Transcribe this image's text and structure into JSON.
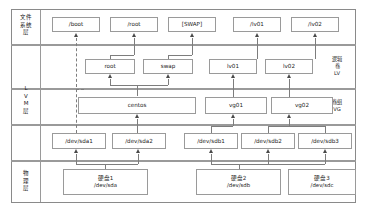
{
  "diagram": {
    "layers": [
      {
        "id": "fs",
        "label_chars": [
          "文件",
          "系统",
          "层"
        ]
      },
      {
        "id": "lvm",
        "label_chars": [
          "L",
          "V",
          "M",
          "层"
        ]
      },
      {
        "id": "physical",
        "label_chars": [
          "物",
          "理",
          "层"
        ]
      }
    ],
    "roles": [
      {
        "id": "lv",
        "name_chars": [
          "逻辑",
          "卷",
          "LV"
        ]
      },
      {
        "id": "vg",
        "name_chars": [
          "卷组",
          "VG"
        ]
      },
      {
        "id": "pv",
        "name_chars": [
          "物理卷",
          "PV"
        ]
      }
    ],
    "mountpoints": [
      {
        "id": "mp-boot",
        "label": "/boot"
      },
      {
        "id": "mp-root",
        "label": "/root"
      },
      {
        "id": "mp-swap",
        "label": "[SWAP]"
      },
      {
        "id": "mp-lv01",
        "label": "/lv01"
      },
      {
        "id": "mp-lv02",
        "label": "/lv02"
      }
    ],
    "logical_volumes": [
      {
        "id": "lv-root",
        "label": "root"
      },
      {
        "id": "lv-swap",
        "label": "swap"
      },
      {
        "id": "lv-lv01",
        "label": "lv01"
      },
      {
        "id": "lv-lv02",
        "label": "lv02"
      }
    ],
    "volume_groups": [
      {
        "id": "vg-centos",
        "label": "centos"
      },
      {
        "id": "vg-vg01",
        "label": "vg01"
      },
      {
        "id": "vg-vg02",
        "label": "vg02"
      }
    ],
    "physical_volumes": [
      {
        "id": "pv-sda1",
        "label": "/dev/sda1"
      },
      {
        "id": "pv-sda2",
        "label": "/dev/sda2"
      },
      {
        "id": "pv-sdb1",
        "label": "/dev/sdb1"
      },
      {
        "id": "pv-sdb2",
        "label": "/dev/sdb2"
      },
      {
        "id": "pv-sdb3",
        "label": "/dev/sdb3"
      }
    ],
    "disks": [
      {
        "id": "disk-sda",
        "name": "硬盘1",
        "device": "/dev/sda"
      },
      {
        "id": "disk-sdb",
        "name": "硬盘2",
        "device": "/dev/sdb"
      },
      {
        "id": "disk-sdc",
        "name": "硬盘3",
        "device": "/dev/sdc"
      }
    ],
    "colors": {
      "border": "#9a9a9a",
      "connector": "#7d7d7d",
      "arrow": "#4a4a4a",
      "text": "#1a1a1a",
      "background": "#ffffff"
    }
  }
}
